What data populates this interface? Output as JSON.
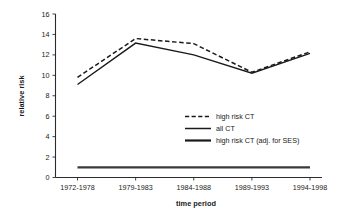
{
  "chart_data": {
    "type": "line",
    "title": "",
    "xlabel": "time period",
    "ylabel": "relative risk",
    "categories": [
      "1972-1978",
      "1979-1983",
      "1984-1988",
      "1989-1993",
      "1994-1998"
    ],
    "ylim": [
      0,
      16
    ],
    "yticks": [
      0,
      2,
      4,
      6,
      8,
      10,
      12,
      14,
      16
    ],
    "ytick_labels": [
      "0",
      "2",
      "4",
      "6",
      "8",
      "10",
      "12",
      "14",
      "16"
    ],
    "grid": false,
    "legend_position": "center-right-inside",
    "series": [
      {
        "name": "high risk CT",
        "style": "dashed",
        "values": [
          9.8,
          13.6,
          13.1,
          10.3,
          12.3
        ]
      },
      {
        "name": "all CT",
        "style": "solid-thin",
        "values": [
          9.1,
          13.15,
          12.0,
          10.2,
          12.15
        ]
      },
      {
        "name": "high risk CT (adj. for SES)",
        "style": "solid-thick",
        "values": [
          1.0,
          1.0,
          1.0,
          1.0,
          1.0
        ]
      }
    ]
  },
  "axes": {
    "y_title": "relative risk",
    "x_title": "time period"
  },
  "legend": {
    "entries": [
      {
        "label": "high risk CT"
      },
      {
        "label": "all CT"
      },
      {
        "label": "high risk CT (adj. for SES)"
      }
    ]
  }
}
